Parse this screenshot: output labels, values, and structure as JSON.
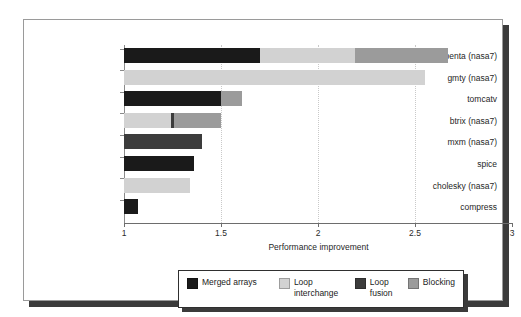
{
  "chart_data": {
    "type": "bar",
    "orientation": "horizontal",
    "stacked": true,
    "title": "",
    "xlabel": "Performance improvement",
    "ylabel": "",
    "xlim": [
      1,
      3
    ],
    "xticks": [
      "1",
      "1.5",
      "2",
      "2.5",
      "3"
    ],
    "xtick_values": [
      1,
      1.5,
      2,
      2.5,
      3
    ],
    "grid": "vertical dotted gridlines at 1.5, 2, 2.5",
    "legend_position": "below plot, centered",
    "categories": [
      "vpenta (nasa7)",
      "gmty (nasa7)",
      "tomcatv",
      "btrix (nasa7)",
      "mxm (nasa7)",
      "spice",
      "cholesky (nasa7)",
      "compress"
    ],
    "series": [
      {
        "name": "Merged arrays",
        "color": "#1a1a1a",
        "values": [
          0.7,
          0.0,
          0.5,
          0.0,
          0.0,
          0.36,
          0.0,
          0.07
        ]
      },
      {
        "name": "Loop interchange",
        "color": "#d2d2d2",
        "values": [
          0.49,
          1.55,
          0.0,
          0.24,
          0.0,
          0.0,
          0.34,
          0.0
        ]
      },
      {
        "name": "Loop fusion",
        "color": "#3c3c3c",
        "values": [
          0.0,
          0.0,
          0.0,
          0.02,
          0.4,
          0.0,
          0.0,
          0.0
        ]
      },
      {
        "name": "Blocking",
        "color": "#9b9b9b",
        "values": [
          0.48,
          0.0,
          0.11,
          0.24,
          0.0,
          0.0,
          0.0,
          0.0
        ]
      }
    ],
    "totals": [
      2.67,
      2.55,
      1.61,
      1.5,
      1.4,
      1.36,
      1.34,
      1.07
    ],
    "bar_segments": [
      {
        "category": "vpenta (nasa7)",
        "segments": [
          {
            "series": "Merged arrays",
            "start": 1.0,
            "end": 1.7
          },
          {
            "series": "Loop interchange",
            "start": 1.7,
            "end": 2.19
          },
          {
            "series": "Blocking",
            "start": 2.19,
            "end": 2.67
          }
        ]
      },
      {
        "category": "gmty (nasa7)",
        "segments": [
          {
            "series": "Loop interchange",
            "start": 1.0,
            "end": 2.55
          }
        ]
      },
      {
        "category": "tomcatv",
        "segments": [
          {
            "series": "Merged arrays",
            "start": 1.0,
            "end": 1.5
          },
          {
            "series": "Blocking",
            "start": 1.5,
            "end": 1.61
          }
        ]
      },
      {
        "category": "btrix (nasa7)",
        "segments": [
          {
            "series": "Loop interchange",
            "start": 1.0,
            "end": 1.24
          },
          {
            "series": "Loop fusion",
            "start": 1.24,
            "end": 1.26
          },
          {
            "series": "Blocking",
            "start": 1.26,
            "end": 1.5
          }
        ]
      },
      {
        "category": "mxm (nasa7)",
        "segments": [
          {
            "series": "Loop fusion",
            "start": 1.0,
            "end": 1.4
          }
        ]
      },
      {
        "category": "spice",
        "segments": [
          {
            "series": "Merged arrays",
            "start": 1.0,
            "end": 1.36
          }
        ]
      },
      {
        "category": "cholesky (nasa7)",
        "segments": [
          {
            "series": "Loop interchange",
            "start": 1.0,
            "end": 1.34
          }
        ]
      },
      {
        "category": "compress",
        "segments": [
          {
            "series": "Merged arrays",
            "start": 1.0,
            "end": 1.07
          }
        ]
      }
    ]
  },
  "legend": {
    "items": [
      {
        "label": "Merged arrays",
        "color": "#1a1a1a"
      },
      {
        "label": "Loop interchange",
        "color": "#d2d2d2"
      },
      {
        "label": "Loop fusion",
        "color": "#3c3c3c"
      },
      {
        "label": "Blocking",
        "color": "#9b9b9b"
      }
    ]
  },
  "axis": {
    "x_title": "Performance improvement",
    "x_tick_labels": [
      "1",
      "1.5",
      "2",
      "2.5",
      "3"
    ]
  }
}
